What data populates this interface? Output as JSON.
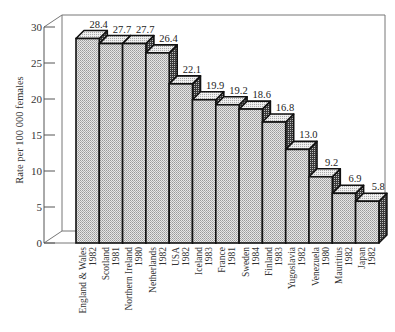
{
  "chart_data": {
    "type": "bar",
    "style": "3d",
    "title": "",
    "xlabel": "",
    "ylabel": "Rate per 100 000 females",
    "ylim": [
      0,
      30
    ],
    "yticks": [
      0,
      5,
      10,
      15,
      20,
      25,
      30
    ],
    "grid": false,
    "legend": null,
    "categories": [
      {
        "country": "England & Wales",
        "year": "1982"
      },
      {
        "country": "Scotland",
        "year": "1981"
      },
      {
        "country": "Northern Ireland",
        "year": "1980"
      },
      {
        "country": "Netherlands",
        "year": "1982"
      },
      {
        "country": "USA",
        "year": "1982"
      },
      {
        "country": "Iceland",
        "year": "1983"
      },
      {
        "country": "France",
        "year": "1981"
      },
      {
        "country": "Sweden",
        "year": "1984"
      },
      {
        "country": "Finland",
        "year": "1983"
      },
      {
        "country": "Yugoslavia",
        "year": "1982"
      },
      {
        "country": "Venezuela",
        "year": "1980"
      },
      {
        "country": "Mauritius",
        "year": "1982"
      },
      {
        "country": "Japan",
        "year": "1982"
      }
    ],
    "values": [
      28.4,
      27.7,
      27.7,
      26.4,
      22.1,
      19.9,
      19.2,
      18.6,
      16.8,
      13.0,
      9.2,
      6.9,
      5.8
    ],
    "value_labels": [
      "28.4",
      "27.7",
      "27.7",
      "26.4",
      "22.1",
      "19.9",
      "19.2",
      "18.6",
      "16.8",
      "13.0",
      "9.2",
      "6.9",
      "5.8"
    ]
  },
  "colors": {
    "bar_front": "#d4d4d4",
    "bar_top": "#e2e2e2",
    "bar_side": "#555555",
    "outline": "#111111",
    "frame": "#777777"
  }
}
